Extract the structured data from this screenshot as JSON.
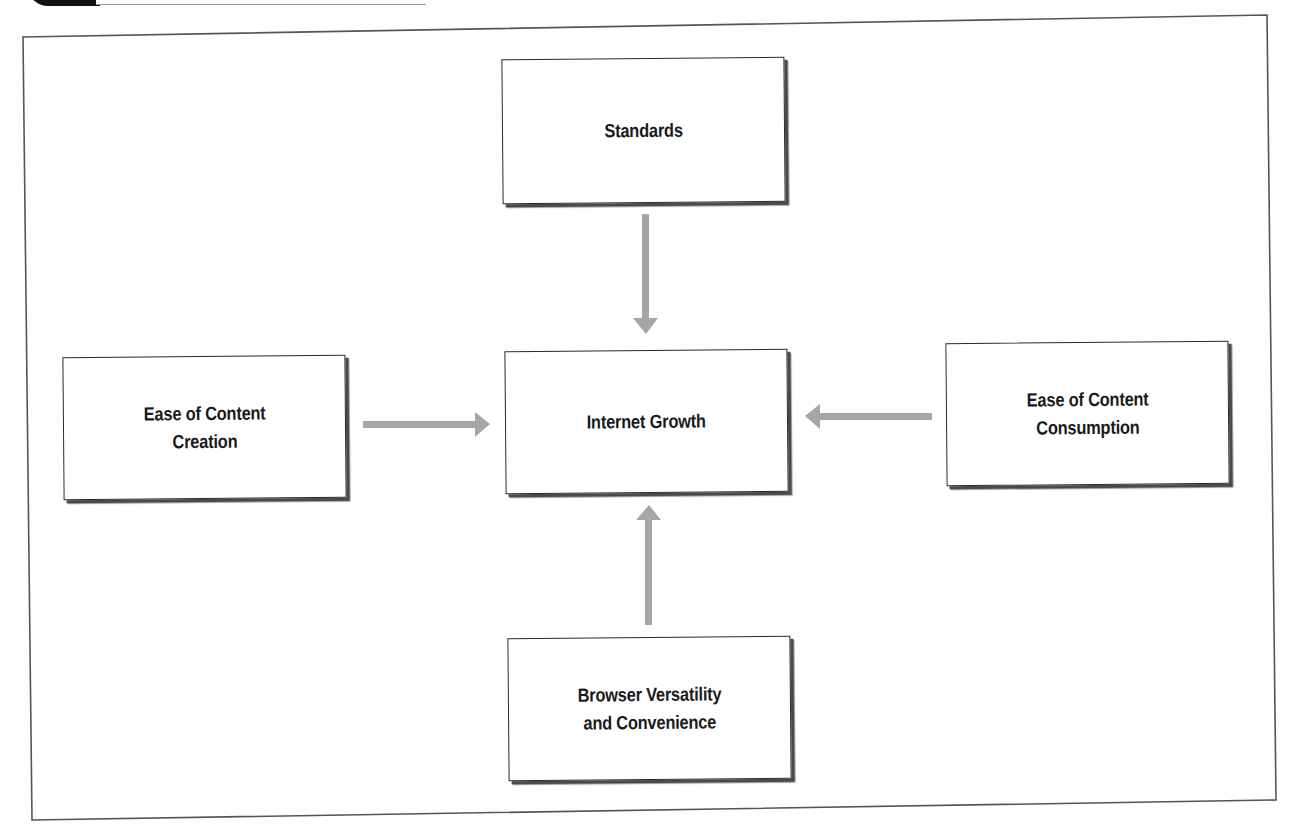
{
  "header": {
    "partial_text": "PREVIEW",
    "tab_color": "#111111"
  },
  "diagram": {
    "title": "",
    "center": {
      "label": "Internet Growth",
      "lines": [
        "Internet Growth"
      ]
    },
    "nodes": [
      {
        "id": "standards",
        "label": "Standards",
        "lines": [
          "Standards"
        ],
        "position": "top",
        "arrow_direction": "down"
      },
      {
        "id": "content-creation",
        "label": "Ease of Content Creation",
        "lines": [
          "Ease of Content",
          "Creation"
        ],
        "position": "left",
        "arrow_direction": "right"
      },
      {
        "id": "content-consumption",
        "label": "Ease of Content Consumption",
        "lines": [
          "Ease of Content",
          "Consumption"
        ],
        "position": "right",
        "arrow_direction": "left"
      },
      {
        "id": "browser-versatility",
        "label": "Browser Versatility and Convenience",
        "lines": [
          "Browser Versatility",
          "and Convenience"
        ],
        "position": "bottom",
        "arrow_direction": "up"
      }
    ],
    "edges": [
      {
        "from": "standards",
        "to": "internet-growth"
      },
      {
        "from": "content-creation",
        "to": "internet-growth"
      },
      {
        "from": "content-consumption",
        "to": "internet-growth"
      },
      {
        "from": "browser-versatility",
        "to": "internet-growth"
      }
    ],
    "colors": {
      "arrow": "#a6a6a6",
      "box_border": "#2a2a2a",
      "box_shadow": "#4a4a4a",
      "frame": "#555555",
      "text": "#1a1a1a"
    }
  }
}
